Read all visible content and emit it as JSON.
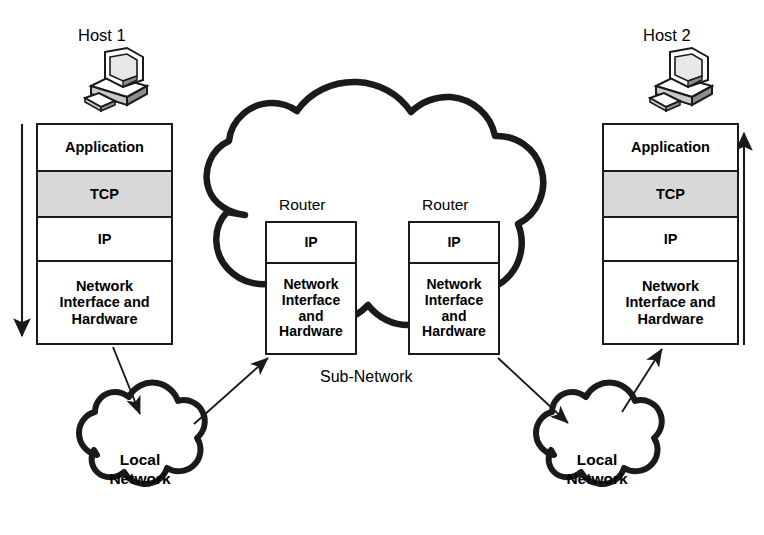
{
  "diagram": {
    "background_color": "#ffffff",
    "line_color": "#1a1a1a",
    "shade_color": "#d8d8d8"
  },
  "hosts": [
    {
      "id": "host1",
      "label": "Host 1",
      "icon": "desktop-computer-icon",
      "arrow_direction": "down",
      "layers": [
        {
          "name": "Application",
          "shaded": false
        },
        {
          "name": "TCP",
          "shaded": true
        },
        {
          "name": "IP",
          "shaded": false
        },
        {
          "name": "Network\nInterface and\nHardware",
          "shaded": false
        }
      ]
    },
    {
      "id": "host2",
      "label": "Host 2",
      "icon": "desktop-computer-icon",
      "arrow_direction": "up",
      "layers": [
        {
          "name": "Application",
          "shaded": false
        },
        {
          "name": "TCP",
          "shaded": true
        },
        {
          "name": "IP",
          "shaded": false
        },
        {
          "name": "Network\nInterface and\nHardware",
          "shaded": false
        }
      ]
    }
  ],
  "routers": [
    {
      "id": "router1",
      "label": "Router",
      "layers": [
        {
          "name": "IP"
        },
        {
          "name": "Network\nInterface\nand\nHardware"
        }
      ]
    },
    {
      "id": "router2",
      "label": "Router",
      "layers": [
        {
          "name": "IP"
        },
        {
          "name": "Network\nInterface\nand\nHardware"
        }
      ]
    }
  ],
  "clouds": [
    {
      "id": "subnetwork",
      "label": "Sub-Network",
      "style": "large-scalloped-cloud"
    },
    {
      "id": "lan-left",
      "label": "Local\nNetwork",
      "style": "small-scalloped-cloud"
    },
    {
      "id": "lan-right",
      "label": "Local\nNetwork",
      "style": "small-scalloped-cloud"
    }
  ],
  "host1_layers": {
    "application": "Application",
    "tcp": "TCP",
    "ip": "IP",
    "network_interface_line1": "Network",
    "network_interface_line2": "Interface and",
    "network_interface_line3": "Hardware"
  },
  "host2_layers": {
    "application": "Application",
    "tcp": "TCP",
    "ip": "IP",
    "network_interface_line1": "Network",
    "network_interface_line2": "Interface and",
    "network_interface_line3": "Hardware"
  },
  "router1_layers": {
    "ip": "IP",
    "network_interface_line1": "Network",
    "network_interface_line2": "Interface",
    "network_interface_line3": "and",
    "network_interface_line4": "Hardware"
  },
  "router2_layers": {
    "ip": "IP",
    "network_interface_line1": "Network",
    "network_interface_line2": "Interface",
    "network_interface_line3": "and",
    "network_interface_line4": "Hardware"
  },
  "labels": {
    "host1": "Host 1",
    "host2": "Host 2",
    "router1": "Router",
    "router2": "Router",
    "subnetwork": "Sub-Network",
    "lan_left_line1": "Local",
    "lan_left_line2": "Network",
    "lan_right_line1": "Local",
    "lan_right_line2": "Network"
  },
  "connections": [
    {
      "from": "host1-network-interface",
      "to": "lan-left-cloud",
      "arrow": true
    },
    {
      "from": "lan-left-cloud",
      "to": "router1-network-interface",
      "arrow": true
    },
    {
      "from": "router2-network-interface",
      "to": "lan-right-cloud",
      "arrow": true
    },
    {
      "from": "lan-right-cloud",
      "to": "host2-network-interface",
      "arrow": true
    }
  ],
  "flow_arrows": [
    {
      "id": "host1-down-arrow",
      "direction": "down",
      "meaning": "data flows down the stack at the sender"
    },
    {
      "id": "host2-up-arrow",
      "direction": "up",
      "meaning": "data flows up the stack at the receiver"
    }
  ]
}
